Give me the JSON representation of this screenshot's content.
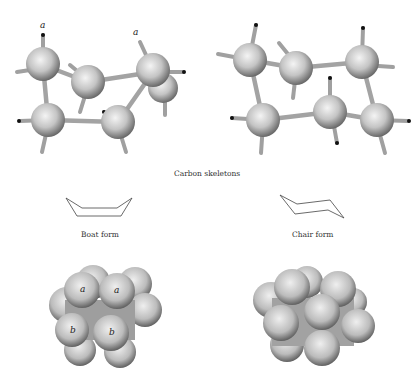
{
  "figure": {
    "captions": {
      "carbon_skeletons": "Carbon skeletons",
      "boat_form": "Boat form",
      "chair_form": "Chair form"
    },
    "labels": {
      "boat_ball_stick_a1": "a",
      "boat_ball_stick_a2": "a",
      "boat_space_fill_a1": "a",
      "boat_space_fill_a2": "a",
      "boat_space_fill_b1": "b",
      "boat_space_fill_b2": "b"
    },
    "colors": {
      "background": "#ffffff",
      "atom_light": "#f2f2f2",
      "atom_mid": "#bdbdbd",
      "atom_dark": "#6e6e6e",
      "bond": "#a8a8a8",
      "bond_tip": "#111111",
      "skeleton_line": "#444444"
    },
    "panels": [
      {
        "name": "boat-ball-and-stick",
        "position": "top-left"
      },
      {
        "name": "chair-ball-and-stick",
        "position": "top-right"
      },
      {
        "name": "boat-skeleton",
        "position": "middle-left"
      },
      {
        "name": "chair-skeleton",
        "position": "middle-right"
      },
      {
        "name": "boat-space-filling",
        "position": "bottom-left"
      },
      {
        "name": "chair-space-filling",
        "position": "bottom-right"
      }
    ]
  }
}
